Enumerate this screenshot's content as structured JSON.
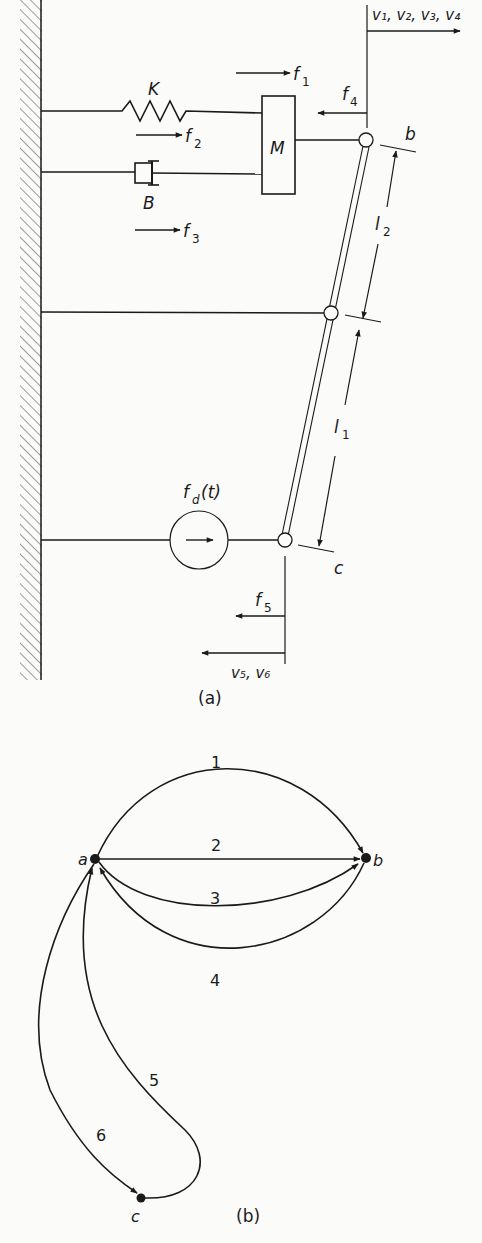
{
  "figure_a": {
    "caption": "(a)",
    "spring_label": "K",
    "damper_label": "B",
    "mass_label": "M",
    "node_b_label": "b",
    "node_c_label": "c",
    "length_upper": "l",
    "length_upper_sub": "2",
    "length_lower": "l",
    "length_lower_sub": "1",
    "source_label": "f",
    "source_sub": "d",
    "source_arg": "(t)",
    "forces": {
      "f1": {
        "base": "f",
        "sub": "1"
      },
      "f2": {
        "base": "f",
        "sub": "2"
      },
      "f3": {
        "base": "f",
        "sub": "3"
      },
      "f4": {
        "base": "f",
        "sub": "4"
      },
      "f5": {
        "base": "f",
        "sub": "5"
      }
    },
    "velocity_top": "v₁, v₂, v₃, v₄",
    "velocity_bottom": "v₅, v₆"
  },
  "figure_b": {
    "caption": "(b)",
    "nodes": [
      {
        "id": "a",
        "label": "a"
      },
      {
        "id": "b",
        "label": "b"
      },
      {
        "id": "c",
        "label": "c"
      }
    ],
    "edges": [
      {
        "label": "1",
        "from": "a",
        "to": "b"
      },
      {
        "label": "2",
        "from": "a",
        "to": "b"
      },
      {
        "label": "3",
        "from": "a",
        "to": "b"
      },
      {
        "label": "4",
        "from": "b",
        "to": "a"
      },
      {
        "label": "5",
        "from": "c",
        "to": "a"
      },
      {
        "label": "6",
        "from": "a",
        "to": "c"
      }
    ]
  },
  "colors": {
    "ink": "#1a1a1a",
    "paper": "#fbfbfa"
  }
}
